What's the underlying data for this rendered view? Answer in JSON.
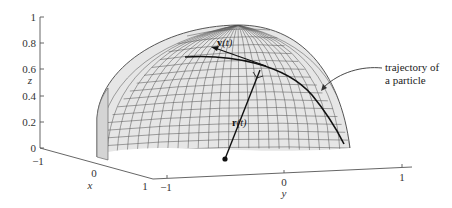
{
  "figure": {
    "type": "3d-surface-diagram"
  },
  "axes": {
    "z": {
      "label": "z",
      "ticks": [
        "0",
        "0.2",
        "0.4",
        "0.6",
        "0.8",
        "1"
      ]
    },
    "x": {
      "label": "x",
      "ticks": [
        "−1",
        "0",
        "1"
      ]
    },
    "y": {
      "label": "y",
      "ticks": [
        "−1",
        "0",
        "1"
      ]
    }
  },
  "vectors": {
    "position": {
      "label": "r(t)",
      "bold": "r",
      "arg": "(t)"
    },
    "velocity": {
      "label": "v(t)",
      "bold": "v",
      "arg": "(t)"
    }
  },
  "annotation": {
    "line1": "trajectory of",
    "line2": "a particle"
  },
  "colors": {
    "surface_fill": "#e6e6e6",
    "grid": "#555555",
    "curve": "#111111",
    "axis": "#555555"
  }
}
